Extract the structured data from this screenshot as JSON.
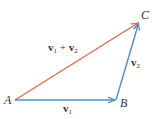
{
  "diagram": {
    "type": "vector-addition-triangle",
    "colors": {
      "v1": "#4a90c8",
      "v2": "#4a90c8",
      "sum": "#e06a50",
      "text": "#333333"
    },
    "points": {
      "A": {
        "label": "A",
        "x": 15,
        "y": 100
      },
      "B": {
        "label": "B",
        "x": 116,
        "y": 100
      },
      "C": {
        "label": "C",
        "x": 139,
        "y": 22
      }
    },
    "vectors": {
      "v1": {
        "symbol": "v",
        "sub": "1",
        "from": "A",
        "to": "B"
      },
      "v2": {
        "symbol": "v",
        "sub": "2",
        "from": "B",
        "to": "C"
      },
      "sum": {
        "symbol1": "v",
        "sub1": "1",
        "op": "+",
        "symbol2": "v",
        "sub2": "2",
        "from": "A",
        "to": "C"
      }
    }
  }
}
